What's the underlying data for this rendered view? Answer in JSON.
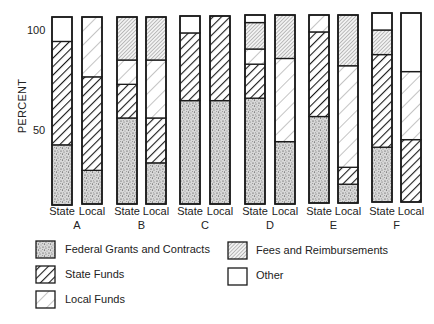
{
  "chart_data": {
    "type": "bar",
    "stacked": true,
    "normalized_to": 100,
    "title": "",
    "xlabel": "",
    "ylabel": "PERCENT",
    "yticks": [
      50,
      100
    ],
    "ylim": [
      0,
      100
    ],
    "grid": false,
    "legend_position": "bottom",
    "groups": [
      "A",
      "B",
      "C",
      "D",
      "E",
      "F"
    ],
    "bar_labels": [
      "State",
      "Local"
    ],
    "series_order": [
      "Federal Grants and Contracts",
      "State Funds",
      "Local Funds",
      "Fees and Reimbursements",
      "Other"
    ],
    "series": [
      {
        "name": "Federal Grants and Contracts",
        "pattern": "stipple",
        "values": [
          32,
          18,
          46,
          22,
          55,
          55,
          56,
          33,
          46,
          10,
          29,
          0
        ]
      },
      {
        "name": "State Funds",
        "pattern": "bold-diagonal",
        "values": [
          55,
          50,
          18,
          24,
          36,
          45,
          18,
          0,
          45,
          9,
          49,
          33
        ]
      },
      {
        "name": "Local Funds",
        "pattern": "light-diagonal",
        "values": [
          0,
          32,
          13,
          31,
          0,
          0,
          8,
          44,
          9,
          54,
          0,
          36
        ]
      },
      {
        "name": "Fees and Reimbursements",
        "pattern": "dense-diagonal",
        "values": [
          0,
          0,
          23,
          23,
          0,
          0,
          14,
          23,
          0,
          27,
          13,
          0
        ]
      },
      {
        "name": "Other",
        "pattern": "blank",
        "values": [
          13,
          0,
          0,
          0,
          9,
          0,
          4,
          0,
          0,
          0,
          9,
          31
        ]
      }
    ],
    "bars": [
      {
        "group": "A",
        "label": "State"
      },
      {
        "group": "A",
        "label": "Local"
      },
      {
        "group": "B",
        "label": "State"
      },
      {
        "group": "B",
        "label": "Local"
      },
      {
        "group": "C",
        "label": "State"
      },
      {
        "group": "C",
        "label": "Local"
      },
      {
        "group": "D",
        "label": "State"
      },
      {
        "group": "D",
        "label": "Local"
      },
      {
        "group": "E",
        "label": "State"
      },
      {
        "group": "E",
        "label": "Local"
      },
      {
        "group": "F",
        "label": "State"
      },
      {
        "group": "F",
        "label": "Local"
      }
    ]
  },
  "axis": {
    "ylabel": "PERCENT",
    "tick_100": "100",
    "tick_50": "50"
  },
  "legend": {
    "items": [
      {
        "label": "Federal Grants and Contracts",
        "pattern": "stipple"
      },
      {
        "label": "State Funds",
        "pattern": "bold-diagonal"
      },
      {
        "label": "Local Funds",
        "pattern": "light-diagonal"
      },
      {
        "label": "Fees and Reimbursements",
        "pattern": "dense-diagonal"
      },
      {
        "label": "Other",
        "pattern": "blank"
      }
    ]
  },
  "colors": {
    "outline": "#1a1a1a",
    "background": "#ffffff"
  }
}
